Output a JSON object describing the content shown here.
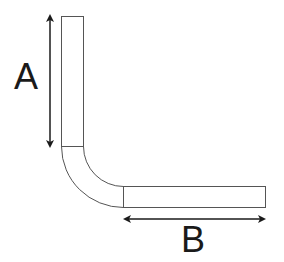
{
  "diagram": {
    "type": "L-shaped bent bar with dimensions",
    "dimensions": [
      {
        "id": "A",
        "label": "A",
        "orientation": "vertical",
        "measures": "vertical leg length"
      },
      {
        "id": "B",
        "label": "B",
        "orientation": "horizontal",
        "measures": "horizontal leg length"
      }
    ],
    "colors": {
      "outline": "#555555",
      "arrow": "#1a1a1a",
      "background": "#ffffff"
    }
  }
}
